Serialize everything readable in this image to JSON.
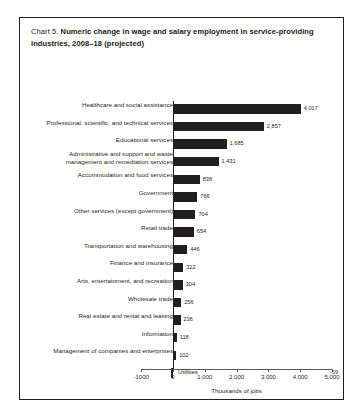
{
  "figure": {
    "label": "Chart 5.",
    "title": "Numeric change in wage and salary employment in service-providing industries, 2008–18 (projected)",
    "frame_color": "#231f20",
    "bar_color": "#231f20",
    "axis_color": "#58595b"
  },
  "chart_data": {
    "type": "bar",
    "orientation": "horizontal",
    "title": "Chart 5. Numeric change in wage and salary employment in service-providing industries, 2008–18 (projected)",
    "xlabel": "Thousands of jobs",
    "ylabel": "",
    "xlim": [
      -1000,
      5000
    ],
    "xticks": [
      -1000,
      0,
      1000,
      2000,
      3000,
      4000,
      5000
    ],
    "xticklabels": [
      "-1000",
      "0",
      "1,000",
      "2,000",
      "3,000",
      "4,000",
      "5,000"
    ],
    "grid": false,
    "legend": null,
    "categories": [
      "Healthcare and social assistance",
      "Professional, scientific, and technical services",
      "Educational services",
      "Administrative and support and waste management and remediation services",
      "Accommodation and food services",
      "Government",
      "Other services (except government)",
      "Retail trade",
      "Transportation and warehousing",
      "Finance and insurance",
      "Arts, entertainment, and recreation",
      "Wholesale trade",
      "Real estate and rental and leasing",
      "Information",
      "Management of companies and enterprises",
      "Utilities"
    ],
    "values": [
      4017,
      2857,
      1685,
      1431,
      838,
      766,
      704,
      654,
      446,
      322,
      304,
      256,
      236,
      118,
      102,
      -59
    ],
    "value_labels": [
      "4,017",
      "2,857",
      "1,685",
      "1,431",
      "838",
      "766",
      "704",
      "654",
      "446",
      "322",
      "304",
      "256",
      "236",
      "118",
      "102",
      "-59"
    ]
  },
  "rows": [
    {
      "label": "Healthcare and social assistance",
      "value_label": "4,017"
    },
    {
      "label": "Professional, scientific, and technical services",
      "value_label": "2,857"
    },
    {
      "label": "Educational services",
      "value_label": "1,685"
    },
    {
      "label": "Administrative and support and waste\nmanagement and remediation services",
      "value_label": "1,431"
    },
    {
      "label": "Accommodation and food services",
      "value_label": "838"
    },
    {
      "label": "Government",
      "value_label": "766"
    },
    {
      "label": "Other services (except government)",
      "value_label": "704"
    },
    {
      "label": "Retail trade",
      "value_label": "654"
    },
    {
      "label": "Transportation and warehousing",
      "value_label": "446"
    },
    {
      "label": "Finance and insurance",
      "value_label": "322"
    },
    {
      "label": "Arts, entertainment, and recreation",
      "value_label": "304"
    },
    {
      "label": "Wholesale trade",
      "value_label": "256"
    },
    {
      "label": "Real estate and rental and leasing",
      "value_label": "236"
    },
    {
      "label": "Information",
      "value_label": "118"
    },
    {
      "label": "Management of companies and enterprises",
      "value_label": "102"
    },
    {
      "label": "",
      "value_label": "-59",
      "inside_name": "Utilities"
    }
  ],
  "axis": {
    "ticklabels": [
      "-1000",
      "0",
      "1,000",
      "2,000",
      "3,000",
      "4,000",
      "5,000"
    ],
    "title": "Thousands of jobs"
  }
}
